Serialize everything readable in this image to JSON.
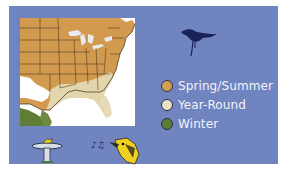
{
  "panel": {
    "background": "#7084c0"
  },
  "map": {
    "region": "Eastern United States",
    "ranges": [
      "spring-summer",
      "year-round",
      "winter"
    ]
  },
  "legend": {
    "items": [
      {
        "label": "Spring/Summer",
        "color": "#d4a050"
      },
      {
        "label": "Year-Round",
        "color": "#ece3c6"
      },
      {
        "label": "Winter",
        "color": "#5e7d35"
      }
    ]
  },
  "icons": {
    "bird": "bird-silhouette-icon",
    "feeder": "birdbath-icon",
    "song": "singing-bird-icon"
  }
}
